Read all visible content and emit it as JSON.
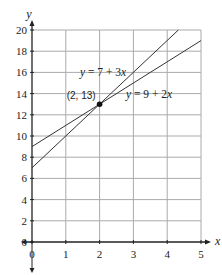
{
  "chart_data": {
    "type": "line",
    "title": "",
    "xlabel": "x",
    "ylabel": "y",
    "xlim": [
      0,
      5
    ],
    "ylim": [
      0,
      20
    ],
    "x_ticks": [
      "0",
      "1",
      "2",
      "3",
      "4",
      "5"
    ],
    "y_ticks": [
      "0",
      "2",
      "4",
      "6",
      "8",
      "10",
      "12",
      "14",
      "16",
      "18",
      "20"
    ],
    "grid": true,
    "series": [
      {
        "name": "y = 7 + 3x",
        "x": [
          0,
          4.33
        ],
        "values": [
          7,
          20
        ],
        "label": "y = 7 + 3x"
      },
      {
        "name": "y = 9 + 2x",
        "x": [
          0,
          5
        ],
        "values": [
          9,
          19
        ],
        "label": "y = 9 + 2x"
      }
    ],
    "annotations": [
      {
        "text": "(2, 13)",
        "x": 2,
        "y": 13,
        "marker": "filled-circle"
      }
    ]
  },
  "labels": {
    "x_axis": "x",
    "y_axis": "y",
    "eq1": "y = 7 + 3x",
    "eq2": "y = 9 + 2x",
    "point": "(2, 13)"
  }
}
